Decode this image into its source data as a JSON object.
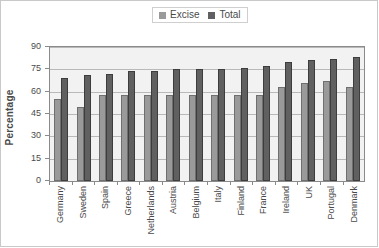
{
  "chart_data": {
    "type": "bar",
    "title": "",
    "xlabel": "",
    "ylabel": "Percentage",
    "ylim": [
      0,
      90
    ],
    "yticks": [
      0,
      15,
      30,
      45,
      60,
      75,
      90
    ],
    "grid": true,
    "legend_position": "top-center",
    "categories": [
      "Germany",
      "Sweden",
      "Spain",
      "Greece",
      "Netherlands",
      "Austria",
      "Belgium",
      "Italy",
      "Finland",
      "France",
      "Ireland",
      "UK",
      "Portugal",
      "Denmark"
    ],
    "series": [
      {
        "name": "Excise",
        "color": "#9a9a9a",
        "values": [
          55,
          50,
          58,
          58,
          58,
          58,
          58,
          58,
          58,
          58,
          63,
          66,
          67,
          63
        ]
      },
      {
        "name": "Total",
        "color": "#606060",
        "values": [
          69,
          71,
          72,
          74,
          74,
          75,
          75,
          75,
          76,
          77,
          80,
          81,
          82,
          83
        ]
      }
    ]
  },
  "legend": {
    "items": [
      {
        "label": "Excise",
        "color": "#9a9a9a"
      },
      {
        "label": "Total",
        "color": "#606060"
      }
    ]
  },
  "axes": {
    "y_title": "Percentage"
  }
}
